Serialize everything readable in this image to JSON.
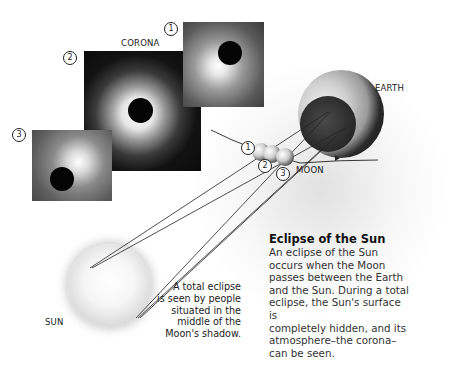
{
  "labels": {
    "corona": "CORONA",
    "earth": "EARTH",
    "moon": "MOON",
    "sun": "SUN"
  },
  "photo_numbers": [
    "1",
    "2",
    "3"
  ],
  "moon_position_numbers": [
    "1",
    "2",
    "3"
  ],
  "caption": {
    "title": "Eclipse of the Sun",
    "lines": [
      "An eclipse of the Sun",
      "occurs when the Moon",
      "passes between the Earth",
      "and the Sun. During a total",
      "eclipse, the Sun's surface is",
      "completely hidden, and its",
      "atmosphere–the corona–",
      "can be seen."
    ]
  },
  "note": {
    "lines": [
      "A total eclipse",
      "is seen by people",
      "situated in the",
      "middle of the",
      "Moon's shadow."
    ]
  },
  "colors": {
    "line": "#222222",
    "text": "#333333",
    "title": "#111111"
  }
}
